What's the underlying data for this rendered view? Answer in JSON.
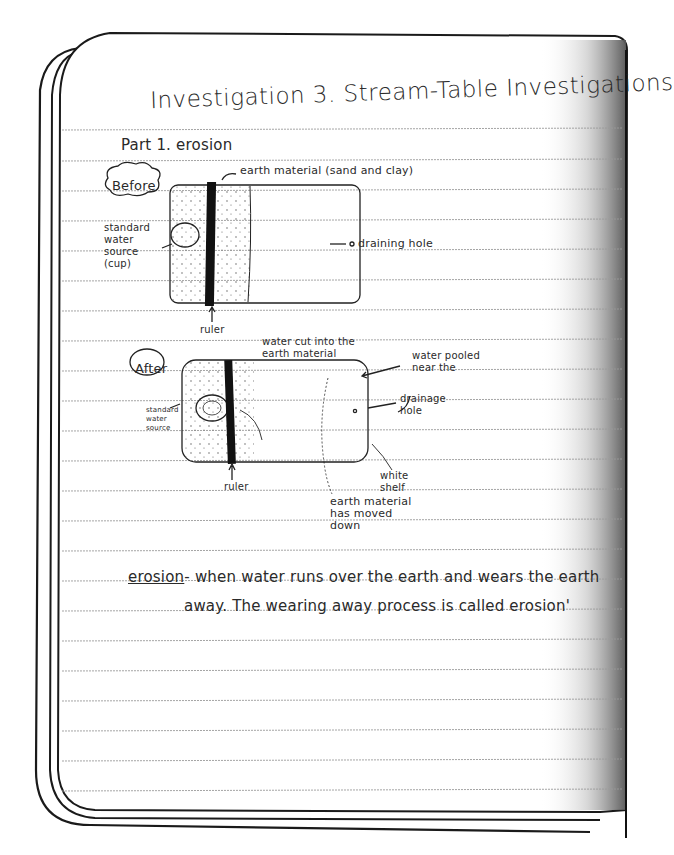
{
  "document": {
    "type": "handwritten science notebook page",
    "title": "Investigation 3. Stream-Table Investigations",
    "section_heading": "Part 1. erosion",
    "diagrams": {
      "before": {
        "label": "Before",
        "annotations": {
          "earth_material": "earth material (sand and clay)",
          "water_source": "standard water source (cup)",
          "drain": "draining hole",
          "ruler": "ruler"
        }
      },
      "after": {
        "label": "After",
        "annotations": {
          "water_cut": "water cut into the earth material",
          "water_pooled": "water pooled near the",
          "drainage": "drainage hole",
          "water_source": "standard water source",
          "ruler": "ruler",
          "shelf": "white shelf",
          "moved": "earth material has moved down"
        }
      }
    },
    "definition": {
      "term": "erosion",
      "line1_rest": "- when water runs over the earth and wears the earth",
      "line2": "away. The wearing away process is called erosion'"
    }
  },
  "style": {
    "ink_color": "#2a2a2a",
    "rule_color": "#9a9a9a",
    "paper_color": "#ffffff"
  }
}
